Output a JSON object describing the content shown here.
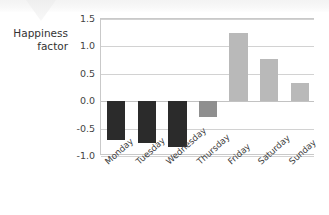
{
  "chart_data": {
    "type": "bar",
    "title": "",
    "subtitle": "",
    "xlabel": "",
    "ylabel": "Happiness\nfactor",
    "categories": [
      "Monday",
      "Tuesday",
      "Wednesday",
      "Thursday",
      "Friday",
      "Saturday",
      "Sunday"
    ],
    "values": [
      -0.7,
      -0.76,
      -0.83,
      -0.28,
      1.24,
      0.77,
      0.33
    ],
    "bar_colors": [
      "#2b2b2b",
      "#2b2b2b",
      "#2b2b2b",
      "#8f8f8f",
      "#b9b9b9",
      "#b9b9b9",
      "#b9b9b9"
    ],
    "ylim": [
      -1.0,
      1.5
    ],
    "yticks": [
      1.5,
      1.0,
      0.5,
      0.0,
      -0.5,
      -1.0
    ],
    "ytick_labels": [
      "1.5",
      "1.0",
      "0.5",
      "0.0",
      "-0.5",
      "-1.0"
    ],
    "grid": true,
    "legend": false,
    "legend_position": "none",
    "annotations": []
  },
  "axis": {
    "y_title": "Happiness\nfactor"
  },
  "colors": {
    "negative_dark": "#2b2b2b",
    "negative_medium": "#8f8f8f",
    "positive_light": "#b9b9b9",
    "grid": "#d2d2d2",
    "frame": "#c9c9c9",
    "text": "#3a3a3a",
    "background": "#ffffff"
  }
}
